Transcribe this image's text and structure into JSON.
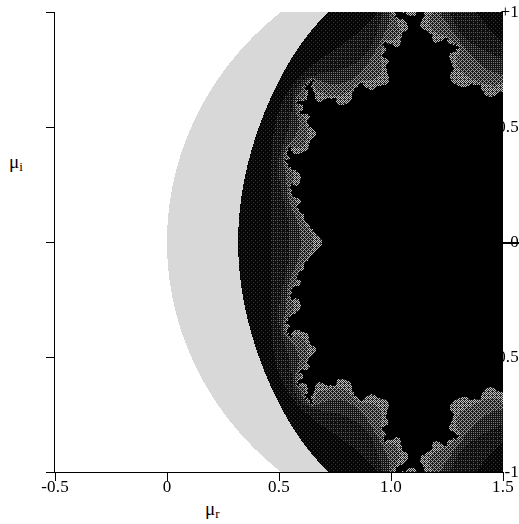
{
  "figure": {
    "background_color": "#ffffff",
    "plot_background_color": "#000000"
  },
  "axes": {
    "x_title_mu": "μ",
    "x_title_sub": "r",
    "y_title_mu": "μ",
    "y_title_sub": "i",
    "x_ticks": [
      {
        "label": "-0.5",
        "value": -0.5
      },
      {
        "label": "0",
        "value": 0.0
      },
      {
        "label": "0.5",
        "value": 0.5
      },
      {
        "label": "1.0",
        "value": 1.0
      },
      {
        "label": "1.5",
        "value": 1.5
      }
    ],
    "y_ticks": [
      {
        "label": "+1",
        "value": 1.0
      },
      {
        "label": "0.5",
        "value": 0.5
      },
      {
        "label": "0",
        "value": 0.0
      },
      {
        "label": "-0.5",
        "value": -0.5
      },
      {
        "label": "-1",
        "value": -1.0
      }
    ]
  },
  "annotations": {
    "right_pointer_label": "",
    "right_pointer_value_mu_i": 0.0
  },
  "chart_data": {
    "type": "heatmap",
    "title": "",
    "subtitle": "",
    "xlabel": "μ_r",
    "ylabel": "μ_i",
    "xlim": [
      -0.5,
      1.5
    ],
    "ylim": [
      -1.0,
      1.0
    ],
    "xtick_labels": [
      "-0.5",
      "0",
      "0.5",
      "1.0",
      "1.5"
    ],
    "xtick_values": [
      -0.5,
      0,
      0.5,
      1.0,
      1.5
    ],
    "ytick_labels": [
      "+1",
      "0.5",
      "0",
      "-0.5",
      "-1"
    ],
    "ytick_values": [
      1.0,
      0.5,
      0,
      -0.5,
      -1.0
    ],
    "grid": false,
    "legend": false,
    "colorbar": false,
    "field": "mandelbrot-escape-time",
    "orientation": "mirrored-horizontally",
    "mapping_note": "mu = 1 - c ; cardioid of the Mandelbrot set appears as the large disk centered near mu_r = 0.2, the period-2 disk appears near mu_r = 1.0",
    "mu_center_main_disk": [
      0.2,
      0.0
    ],
    "mu_center_period2_disk": [
      1.0,
      0.0
    ],
    "mu_radius_period2_disk": 0.25,
    "max_iterations": 60,
    "escape_radius": 2.0,
    "band_colors": [
      "#000000",
      "#ffffff",
      "#d8d8d8",
      "#101010",
      "#282828",
      "#3c3c3c",
      "#565656",
      "#6e6e6e",
      "#000000"
    ],
    "band_iteration_edges": [
      2,
      3,
      4,
      5,
      6,
      8,
      11,
      16
    ],
    "interior_color": "#000000",
    "boundary_color": "#f0f0f0",
    "dither": true,
    "features": [
      {
        "name": "main-disk",
        "mu_r": 0.2,
        "mu_i": 0.0,
        "approx_radius": 0.5
      },
      {
        "name": "period-2-disk",
        "mu_r": 1.0,
        "mu_i": 0.0,
        "approx_radius": 0.25
      },
      {
        "name": "upper-period-3-bulb",
        "mu_r": 0.125,
        "mu_i": 0.74,
        "approx_radius": 0.095
      },
      {
        "name": "lower-period-3-bulb",
        "mu_r": 0.125,
        "mu_i": -0.74,
        "approx_radius": 0.095
      },
      {
        "name": "period-4-satellite-right",
        "mu_r": 1.31,
        "mu_i": 0.0,
        "approx_radius": 0.06
      }
    ]
  }
}
